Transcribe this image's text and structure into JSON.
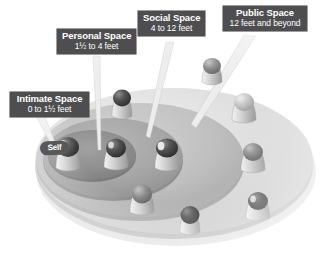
{
  "figure": {
    "background_color": "#ffffff",
    "style": "grayscale 3d isometric concentric discs"
  },
  "colors": {
    "label_box": "#4e4e50",
    "label_text": "#ffffff",
    "disc_outer": "#d9d9d9",
    "disc_social": "#c2c2c2",
    "disc_personal": "#a8a8a8",
    "disc_intimate": "#8f8f8f",
    "leader_line": "#efefef",
    "figure_body": "#c9c9c9",
    "figure_head_dark": "#4a4a4a",
    "shadow": "#b8b8b8"
  },
  "callouts": [
    {
      "id": "intimate",
      "title": "Intimate Space",
      "subtitle": "0 to 1½ feet",
      "subtitle_prefix": "0 to 1",
      "subtitle_fraction": "⁄",
      "subtitle_suffix": " feet",
      "range_min_feet": 0,
      "range_max_feet": 1.5
    },
    {
      "id": "personal",
      "title": "Personal Space",
      "subtitle": "1½ to 4 feet",
      "range_min_feet": 1.5,
      "range_max_feet": 4
    },
    {
      "id": "social",
      "title": "Social Space",
      "subtitle": "4 to 12 feet",
      "range_min_feet": 4,
      "range_max_feet": 12
    },
    {
      "id": "public",
      "title": "Public Space",
      "subtitle": "12 feet and beyond",
      "range_min_feet": 12,
      "range_max_feet": null
    }
  ],
  "center_marker": {
    "label": "Self"
  },
  "top_clipped_text": " "
}
